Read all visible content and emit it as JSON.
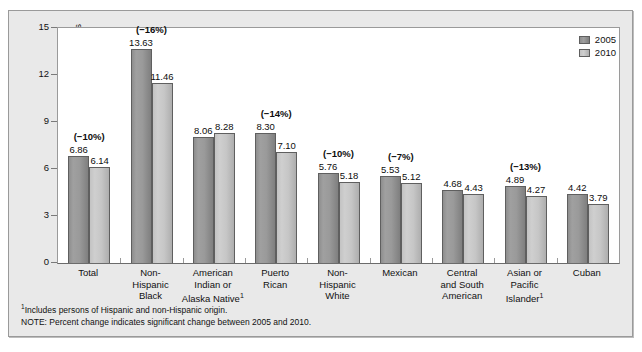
{
  "chart_data": {
    "type": "bar",
    "title": "",
    "xlabel": "",
    "ylabel": "Rate per 1000 Live Births",
    "ylim": [
      0,
      15
    ],
    "yticks": [
      "0",
      "3",
      "6",
      "9",
      "12",
      "15"
    ],
    "grid": false,
    "legend_position": "top-right",
    "categories": [
      "Total",
      "Non-Hispanic Black",
      "American Indian or Alaska Native¹",
      "Puerto Rican",
      "Non-Hispanic White",
      "Mexican",
      "Central and South American",
      "Asian or Pacific Islander¹",
      "Cuban"
    ],
    "category_lines": [
      [
        "Total"
      ],
      [
        "Non-",
        "Hispanic",
        "Black"
      ],
      [
        "American",
        "Indian or",
        "Alaska Native¹"
      ],
      [
        "Puerto",
        "Rican"
      ],
      [
        "Non-",
        "Hispanic",
        "White"
      ],
      [
        "Mexican"
      ],
      [
        "Central",
        "and South",
        "American"
      ],
      [
        "Asian or",
        "Pacific",
        "Islander¹"
      ],
      [
        "Cuban"
      ]
    ],
    "series": [
      {
        "name": "2005",
        "color": "#9a9a9a",
        "values": [
          6.86,
          13.63,
          8.06,
          8.3,
          5.76,
          5.53,
          4.68,
          4.89,
          4.42
        ],
        "labels": [
          "6.86",
          "13.63",
          "8.06",
          "8.30",
          "5.76",
          "5.53",
          "4.68",
          "4.89",
          "4.42"
        ]
      },
      {
        "name": "2010",
        "color": "#c6c6c6",
        "values": [
          6.14,
          11.46,
          8.28,
          7.1,
          5.18,
          5.12,
          4.43,
          4.27,
          3.79
        ],
        "labels": [
          "6.14",
          "11.46",
          "8.28",
          "7.10",
          "5.18",
          "5.12",
          "4.43",
          "4.27",
          "3.79"
        ]
      }
    ],
    "annotations": [
      "(−10%)",
      "(−16%)",
      "",
      "(−14%)",
      "(−10%)",
      "(−7%)",
      "",
      "(−13%)",
      ""
    ]
  },
  "legend": {
    "items": [
      {
        "label": "2005",
        "swatch": "y2005"
      },
      {
        "label": "2010",
        "swatch": "y2010"
      }
    ]
  },
  "footnotes": {
    "line1_marker": "1",
    "line1": "Includes persons of Hispanic and non-Hispanic origin.",
    "line2": "NOTE: Percent change indicates significant change between 2005 and 2010."
  }
}
